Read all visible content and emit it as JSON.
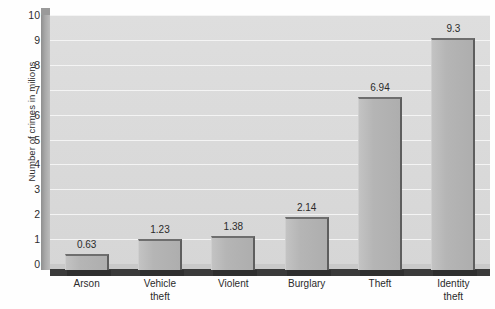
{
  "chart_data": {
    "type": "bar",
    "title": "",
    "xlabel": "",
    "ylabel": "Number of crimes in milions",
    "categories": [
      "Arson",
      "Vehicle theft",
      "Violent",
      "Burglary",
      "Theft",
      "Identity theft"
    ],
    "category_lines": [
      [
        "Arson"
      ],
      [
        "Vehicle",
        "theft"
      ],
      [
        "Violent"
      ],
      [
        "Burglary"
      ],
      [
        "Theft"
      ],
      [
        "Identity",
        "theft"
      ]
    ],
    "values": [
      0.63,
      1.23,
      1.38,
      2.14,
      6.94,
      9.3
    ],
    "value_labels": [
      "0.63",
      "1.23",
      "1.38",
      "2.14",
      "6.94",
      "9.3"
    ],
    "ylim": [
      0,
      10
    ],
    "ytick_step": 1,
    "ytick_labels": [
      "10",
      "9",
      "8",
      "7",
      "6",
      "5",
      "4",
      "3",
      "2",
      "1",
      "0"
    ],
    "grid": true,
    "legend": "none",
    "style": "3d-column",
    "colors": {
      "bar_face": "#b5b5b5",
      "bar_top_edge": "#6e6e6e",
      "bar_side_edge": "#5e5e5e",
      "plot_background": "#dcdcdc",
      "gridline": "#f4f4f4",
      "floor": "#3a3a3a",
      "wall": "#a8a8a8",
      "text": "#2b2b2b"
    }
  }
}
